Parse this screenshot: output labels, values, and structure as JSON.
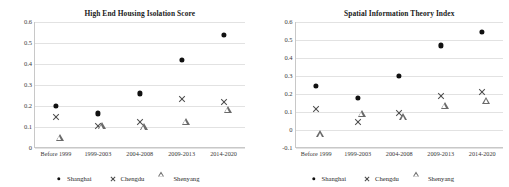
{
  "figure": {
    "panels": [
      "left",
      "right"
    ],
    "series_names": [
      "Shanghai",
      "Chengdu",
      "Shenyang"
    ],
    "marker_icons": [
      "filled-circle-icon",
      "cross-icon",
      "triangle-icon"
    ]
  },
  "legend": {
    "items": [
      {
        "label": "Shanghai",
        "marker": "filled-circle-icon"
      },
      {
        "label": "Chengdu",
        "marker": "cross-icon"
      },
      {
        "label": "Shenyang",
        "marker": "triangle-icon"
      }
    ]
  },
  "chart_data": [
    {
      "type": "scatter",
      "title": "High End Housing Isolation Score",
      "xlabel": "",
      "ylabel": "",
      "categories": [
        "Before 1999",
        "1999-2003",
        "2004-2008",
        "2009-2013",
        "2014-2020"
      ],
      "ylim": [
        0,
        0.6
      ],
      "yticks": [
        0,
        0.1,
        0.2,
        0.3,
        0.4,
        0.5,
        0.6
      ],
      "ytick_labels": [
        "0",
        "0.1",
        "0.2",
        "0.3",
        "0.4",
        "0.5",
        "0.6"
      ],
      "grid": true,
      "legend_position": "bottom",
      "series": [
        {
          "name": "Shanghai",
          "marker": "filled-circle-icon",
          "values": [
            0.2,
            0.165,
            0.26,
            0.42,
            0.54
          ]
        },
        {
          "name": "Chengdu",
          "marker": "cross-icon",
          "values": [
            0.147,
            0.105,
            0.125,
            0.235,
            0.22
          ]
        },
        {
          "name": "Shenyang",
          "marker": "triangle-icon",
          "values": [
            0.065,
            0.12,
            0.115,
            0.14,
            0.2
          ]
        }
      ]
    },
    {
      "type": "scatter",
      "title": "Spatial Information Theory Index",
      "xlabel": "",
      "ylabel": "",
      "categories": [
        "Before 1999",
        "1999-2003",
        "2004-2008",
        "2009-2013",
        "2014-2020"
      ],
      "ylim": [
        -0.1,
        0.6
      ],
      "yticks": [
        -0.1,
        0,
        0.1,
        0.2,
        0.3,
        0.4,
        0.5,
        0.6
      ],
      "ytick_labels": [
        "-0.1",
        "0",
        "0.1",
        "0.2",
        "0.3",
        "0.4",
        "0.5",
        "0.6"
      ],
      "grid": true,
      "legend_position": "bottom",
      "series": [
        {
          "name": "Shanghai",
          "marker": "filled-circle-icon",
          "values": [
            0.245,
            0.178,
            0.3,
            0.47,
            0.545
          ]
        },
        {
          "name": "Chengdu",
          "marker": "cross-icon",
          "values": [
            0.118,
            0.045,
            0.095,
            0.19,
            0.21
          ]
        },
        {
          "name": "Shenyang",
          "marker": "triangle-icon",
          "values": [
            -0.005,
            0.11,
            0.09,
            0.155,
            0.18
          ]
        }
      ]
    }
  ],
  "colors": {
    "shanghai": "#111111",
    "chengdu": "#4a4a4a",
    "shenyang": "#6a6a6a",
    "grid": "#e2e2e2",
    "axis": "#c8c8c8",
    "text": "#1a1a1a"
  }
}
